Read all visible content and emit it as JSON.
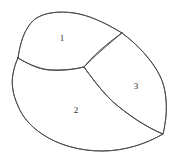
{
  "figure": {
    "background_color": "#ffffff",
    "stroke_color": "#4a4a4a",
    "label_color": "#2b2b2b",
    "width": 178,
    "height": 166,
    "style": "hand-drawn closed contour subdivided into three labeled regions"
  },
  "regions": [
    {
      "id": "region-1",
      "label": "1",
      "label_x": 62,
      "label_y": 38,
      "position": "top-left lobe",
      "outline": "M 18 58 C 20 44 24 28 35 19 C 45 12 60 11 74 13 C 88 15 104 22 122 33 C 112 40 100 50 92 58 C 88 62 86 65 84 67 C 72 70 60 71 48 70 C 38 69 27 64 18 58 Z"
    },
    {
      "id": "region-2",
      "label": "2",
      "label_x": 76,
      "label_y": 110,
      "position": "bottom-left large region",
      "outline": "M 18 58 C 28 64 38 69 48 70 C 60 71 72 70 84 67 C 92 78 100 89 112 101 C 128 115 146 127 163 134 C 146 144 124 151 102 151 C 80 151 58 145 42 134 C 30 126 22 116 18 106 C 13 95 11 84 13 74 C 14 68 16 62 18 58 Z"
    },
    {
      "id": "region-3",
      "label": "3",
      "label_x": 136,
      "label_y": 86,
      "position": "right lobe",
      "outline": "M 122 33 C 138 45 152 60 160 76 C 166 88 167 104 166 116 C 165 125 164 130 163 134 C 146 127 128 115 112 101 C 100 89 92 78 84 67 C 86 65 88 62 92 58 C 100 50 112 40 122 33 Z"
    }
  ],
  "contours": {
    "outer_boundary": "M 18 58 C 20 44 24 28 35 19 C 45 12 60 11 74 13 C 88 15 104 22 122 33 C 138 45 152 60 160 76 C 166 88 167 104 166 116 C 165 125 164 130 163 134 C 146 144 124 151 102 151 C 80 151 58 145 42 134 C 30 126 22 116 18 106 C 13 95 11 84 13 74 C 14 68 16 62 18 58 Z",
    "divider_1_2": "M 18 58 C 30 65 42 70 54 70 C 66 70 76 69 84 67",
    "divider_1_3": "M 84 67 C 88 63 94 57 102 50 C 110 43 117 37 122 33",
    "divider_2_3": "M 84 67 C 92 78 100 89 112 101 C 128 115 146 127 163 134"
  },
  "labels": [
    {
      "text": "1",
      "x": 62,
      "y": 38
    },
    {
      "text": "2",
      "x": 76,
      "y": 110
    },
    {
      "text": "3",
      "x": 136,
      "y": 86
    }
  ]
}
